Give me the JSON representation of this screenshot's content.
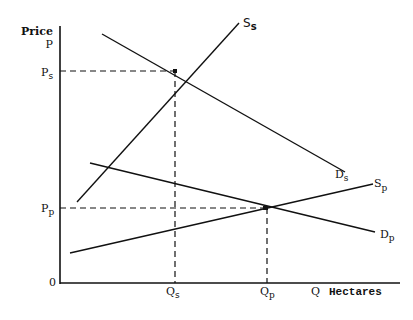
{
  "diagram": {
    "axes": {
      "y_label_line1": "Price",
      "y_label_line2": "P",
      "x_label": "Q",
      "x_unit": "Hectares",
      "origin": "0"
    },
    "price_levels": [
      {
        "main": "P",
        "sub": "s"
      },
      {
        "main": "P",
        "sub": "p"
      }
    ],
    "quantity_levels": [
      {
        "main": "Q",
        "sub": "s"
      },
      {
        "main": "Q",
        "sub": "p"
      }
    ],
    "curves": [
      {
        "name": "supply-s",
        "main": "S",
        "sub": "s"
      },
      {
        "name": "demand-s",
        "main": "D",
        "sub": "s"
      },
      {
        "name": "supply-p",
        "main": "S",
        "sub": "p"
      },
      {
        "name": "demand-p",
        "main": "D",
        "sub": "p"
      }
    ],
    "line_color": "#111111",
    "background": "#ffffff"
  }
}
